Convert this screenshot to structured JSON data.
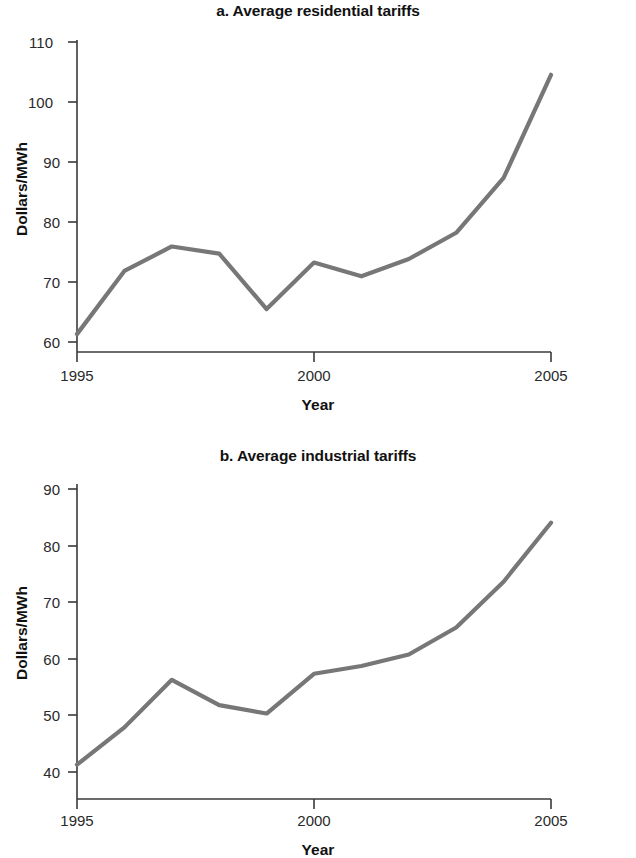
{
  "figure": {
    "background_color": "#ffffff",
    "line_color": "#777777",
    "axis_color": "#3a3a3a",
    "text_color": "#111111"
  },
  "panels": [
    {
      "id": "a",
      "title": "a. Average residential tariffs",
      "ylabel": "Dollars/MWh",
      "xlabel": "Year",
      "yticks": [
        "60",
        "70",
        "80",
        "90",
        "100",
        "110"
      ],
      "xticks": [
        "1995",
        "2000",
        "2005"
      ]
    },
    {
      "id": "b",
      "title": "b. Average industrial tariffs",
      "ylabel": "Dollars/MWh",
      "xlabel": "Year",
      "yticks": [
        "40",
        "50",
        "60",
        "70",
        "80",
        "90"
      ],
      "xticks": [
        "1995",
        "2000",
        "2005"
      ]
    }
  ],
  "chart_data": [
    {
      "type": "line",
      "title": "a. Average residential tariffs",
      "xlabel": "Year",
      "ylabel": "Dollars/MWh",
      "x": [
        1995,
        1996,
        1997,
        1998,
        1999,
        2000,
        2001,
        2002,
        2003,
        2004,
        2005
      ],
      "values": [
        61.0,
        71.6,
        75.7,
        74.5,
        65.2,
        73.0,
        70.7,
        73.6,
        78.0,
        87.2,
        104.5
      ],
      "series": [
        {
          "name": "Average residential tariffs",
          "values": [
            61.0,
            71.6,
            75.7,
            74.5,
            65.2,
            73.0,
            70.7,
            73.6,
            78.0,
            87.2,
            104.5
          ]
        }
      ],
      "xlim": [
        1995,
        2005
      ],
      "ylim": [
        58,
        110
      ],
      "ytick_values": [
        60,
        70,
        80,
        90,
        100,
        110
      ],
      "xtick_values": [
        1995,
        2000,
        2005
      ],
      "grid": false,
      "legend": false
    },
    {
      "type": "line",
      "title": "b. Average industrial tariffs",
      "xlabel": "Year",
      "ylabel": "Dollars/MWh",
      "x": [
        1995,
        1996,
        1997,
        1998,
        1999,
        2000,
        2001,
        2002,
        2003,
        2004,
        2005
      ],
      "values": [
        44.2,
        50.4,
        58.3,
        54.1,
        52.7,
        59.3,
        60.6,
        62.5,
        67.0,
        74.6,
        84.4
      ],
      "series": [
        {
          "name": "Average industrial tariffs",
          "values": [
            44.2,
            50.4,
            58.3,
            54.1,
            52.7,
            59.3,
            60.6,
            62.5,
            67.0,
            74.6,
            84.4
          ]
        }
      ],
      "xlim": [
        1995,
        2005
      ],
      "ylim": [
        38.5,
        90
      ],
      "ytick_values": [
        40,
        50,
        60,
        70,
        80,
        90
      ],
      "xtick_values": [
        1995,
        2000,
        2005
      ],
      "grid": false,
      "legend": false
    }
  ]
}
